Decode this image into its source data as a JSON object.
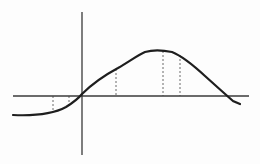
{
  "diagram": {
    "type": "function-graph",
    "colors": {
      "background": "#fdfdfd",
      "axis": "#3a3a3a",
      "curve": "#1e1e1e",
      "guides": "#444444"
    },
    "axes": {
      "x_axis": {
        "y": 96,
        "x_start": 13,
        "x_end": 249
      },
      "y_axis": {
        "x": 82,
        "y_start": 12,
        "y_end": 155
      }
    },
    "curve_path": "M13,115 C35,116 55,113 66,107 C74,102 78,99 82,94 C92,84 105,75 118,68 C130,61 138,55 145,52 C152,50 162,50 172,52 C182,56 192,64 205,76 C215,85 225,94 233,101 L240,104",
    "guides": [
      {
        "x": 53,
        "y1": 96,
        "y2": 112
      },
      {
        "x": 69,
        "y1": 96,
        "y2": 106
      },
      {
        "x": 116,
        "y1": 69,
        "y2": 96
      },
      {
        "x": 163,
        "y1": 51,
        "y2": 96
      },
      {
        "x": 180,
        "y1": 55,
        "y2": 96
      }
    ]
  }
}
